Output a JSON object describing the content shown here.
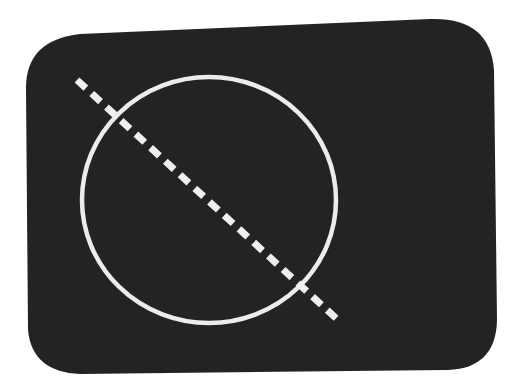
{
  "figure": {
    "canvas": {
      "width": 522,
      "height": 387,
      "background": "#ffffff"
    },
    "screen": {
      "shape": "rounded-rectangle (CRT screen face)",
      "fill": "#232323",
      "path": "M 26 88 Q 26 40 80 34 L 430 19 Q 490 17 494 70 L 497 320 Q 496 368 448 370 L 80 374 Q 32 372 28 330 Z"
    },
    "circle": {
      "cx": 209,
      "cy": 200,
      "rx": 127,
      "ry": 123,
      "stroke": "#ececec",
      "stroke_width": 4.5
    },
    "dashed_line": {
      "x1": 77,
      "y1": 80,
      "x2": 338,
      "y2": 320,
      "stroke": "#efefef",
      "stroke_width": 7,
      "dash": "12 8"
    }
  }
}
